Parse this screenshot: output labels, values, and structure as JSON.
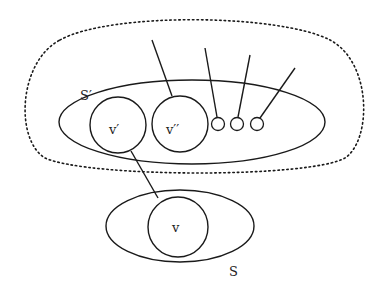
{
  "diagram": {
    "stroke_color": "#1a1a1a",
    "background": "#ffffff",
    "labels": {
      "outer_set": "S′",
      "v_prime": "v′",
      "v_double_prime": "v′′",
      "v": "v",
      "inner_set": "S"
    },
    "nodes": [
      {
        "id": "v_prime",
        "label": "v′",
        "shape": "circle",
        "size": "large"
      },
      {
        "id": "v_double_prime",
        "label": "v′′",
        "shape": "circle",
        "size": "large"
      },
      {
        "id": "small1",
        "label": "",
        "shape": "circle",
        "size": "small"
      },
      {
        "id": "small2",
        "label": "",
        "shape": "circle",
        "size": "small"
      },
      {
        "id": "small3",
        "label": "",
        "shape": "circle",
        "size": "small"
      },
      {
        "id": "v",
        "label": "v",
        "shape": "circle",
        "size": "large"
      }
    ],
    "sets": [
      {
        "id": "S_prime",
        "label": "S′",
        "shape": "ellipse",
        "contains": [
          "v_prime",
          "v_double_prime",
          "small1",
          "small2",
          "small3"
        ]
      },
      {
        "id": "S",
        "label": "S",
        "shape": "ellipse",
        "contains": [
          "v"
        ]
      },
      {
        "id": "outer_region",
        "label": "",
        "shape": "dotted-blob",
        "contains": [
          "S_prime"
        ]
      }
    ],
    "edges": [
      {
        "from": "v_prime",
        "to": "v"
      },
      {
        "from": "v_double_prime",
        "to": "external"
      },
      {
        "from": "small1",
        "to": "external"
      },
      {
        "from": "small2",
        "to": "external"
      },
      {
        "from": "small3",
        "to": "external"
      }
    ]
  }
}
